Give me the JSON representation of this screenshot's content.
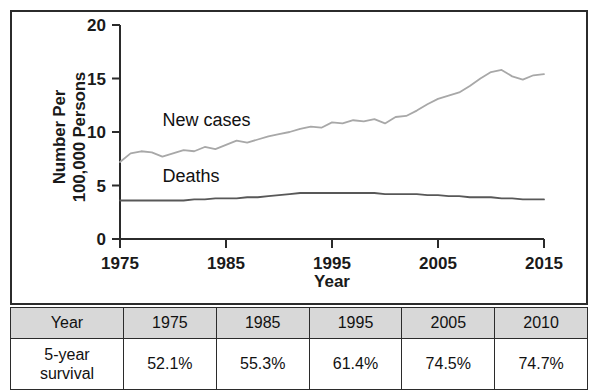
{
  "chart_data": {
    "type": "line",
    "title": "",
    "xlabel": "Year",
    "ylabel": "Number Per 100,000 Persons",
    "ylabel_lines": [
      "Number Per",
      "100,000 Persons"
    ],
    "xlim": [
      1975,
      2015
    ],
    "ylim": [
      0,
      20
    ],
    "ytick_labels": [
      "0",
      "5",
      "10",
      "15",
      "20"
    ],
    "ytick_values": [
      0,
      5,
      10,
      15,
      20
    ],
    "xtick_labels": [
      "1975",
      "1985",
      "1995",
      "2005",
      "2015"
    ],
    "xtick_values": [
      1975,
      1985,
      1995,
      2005,
      2015
    ],
    "grid": false,
    "legend_position": "inline-labels",
    "x": [
      1975,
      1976,
      1977,
      1978,
      1979,
      1980,
      1981,
      1982,
      1983,
      1984,
      1985,
      1986,
      1987,
      1988,
      1989,
      1990,
      1991,
      1992,
      1993,
      1994,
      1995,
      1996,
      1997,
      1998,
      1999,
      2000,
      2001,
      2002,
      2003,
      2004,
      2005,
      2006,
      2007,
      2008,
      2009,
      2010,
      2011,
      2012,
      2013,
      2014,
      2015
    ],
    "series": [
      {
        "name": "New cases",
        "color": "#a8a8a8",
        "label_x": 1979,
        "label_y": 10.6,
        "values": [
          7.2,
          8.0,
          8.2,
          8.1,
          7.7,
          8.0,
          8.3,
          8.2,
          8.6,
          8.4,
          8.8,
          9.2,
          9.0,
          9.3,
          9.6,
          9.8,
          10.0,
          10.3,
          10.5,
          10.4,
          10.9,
          10.8,
          11.1,
          11.0,
          11.2,
          10.8,
          11.4,
          11.5,
          12.0,
          12.6,
          13.1,
          13.4,
          13.7,
          14.3,
          15.0,
          15.6,
          15.8,
          15.2,
          14.9,
          15.3,
          15.4
        ]
      },
      {
        "name": "Deaths",
        "color": "#585858",
        "label_x": 1979,
        "label_y": 5.3,
        "values": [
          3.6,
          3.6,
          3.6,
          3.6,
          3.6,
          3.6,
          3.6,
          3.7,
          3.7,
          3.8,
          3.8,
          3.8,
          3.9,
          3.9,
          4.0,
          4.1,
          4.2,
          4.3,
          4.3,
          4.3,
          4.3,
          4.3,
          4.3,
          4.3,
          4.3,
          4.2,
          4.2,
          4.2,
          4.2,
          4.1,
          4.1,
          4.0,
          4.0,
          3.9,
          3.9,
          3.9,
          3.8,
          3.8,
          3.7,
          3.7,
          3.7
        ]
      }
    ]
  },
  "table": {
    "header": {
      "row_label": "Year",
      "columns": [
        "1975",
        "1985",
        "1995",
        "2005",
        "2010"
      ]
    },
    "body": {
      "row_label_lines": [
        "5-year",
        "survival"
      ],
      "row_label": "5-year survival",
      "values": [
        "52.1%",
        "55.3%",
        "61.4%",
        "74.5%",
        "74.7%"
      ]
    }
  },
  "colors": {
    "new_cases_line": "#a8a8a8",
    "deaths_line": "#585858",
    "axis": "#2b2b2b",
    "frame": "#2b2b2b",
    "table_header_bg": "#d8d8d8",
    "background": "#ffffff"
  }
}
